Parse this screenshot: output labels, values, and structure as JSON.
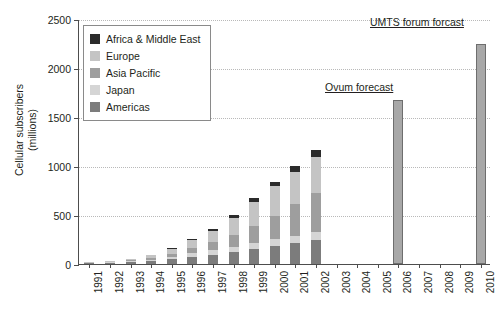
{
  "chart_data": {
    "type": "bar",
    "stacked": true,
    "title": "",
    "xlabel": "",
    "ylabel": "Cellular subscribers\n(millions)",
    "ylabel_line1": "Cellular subscribers",
    "ylabel_line2": "(millions)",
    "ylim": [
      0,
      2500
    ],
    "yticks": [
      0,
      500,
      1000,
      1500,
      2000,
      2500
    ],
    "ytick_labels": [
      "0",
      "500",
      "1000",
      "1500",
      "2000",
      "2500"
    ],
    "grid": "horizontal-dotted",
    "legend_position": "upper-left-inset",
    "categories": [
      "1991",
      "1992",
      "1993",
      "1994",
      "1995",
      "1996",
      "1997",
      "1998",
      "1999",
      "2000",
      "2001",
      "2002",
      "2003",
      "2004",
      "2005",
      "2006",
      "2007",
      "2008",
      "2009",
      "2010"
    ],
    "series": [
      {
        "name": "Americas",
        "color": "#7c7c7c",
        "values": [
          8,
          13,
          22,
          34,
          52,
          72,
          95,
          120,
          152,
          186,
          215,
          242,
          null,
          null,
          null,
          null,
          null,
          null,
          null,
          null
        ]
      },
      {
        "name": "Japan",
        "color": "#d5d5d5",
        "values": [
          2,
          4,
          7,
          12,
          22,
          38,
          48,
          56,
          62,
          68,
          74,
          80,
          null,
          null,
          null,
          null,
          null,
          null,
          null,
          null
        ]
      },
      {
        "name": "Asia Pacific",
        "color": "#9e9e9e",
        "values": [
          2,
          4,
          8,
          16,
          30,
          52,
          78,
          118,
          170,
          240,
          320,
          400,
          null,
          null,
          null,
          null,
          null,
          null,
          null,
          null
        ]
      },
      {
        "name": "Europe",
        "color": "#c4c4c4",
        "values": [
          4,
          8,
          14,
          26,
          48,
          80,
          120,
          175,
          250,
          300,
          330,
          370,
          null,
          null,
          null,
          null,
          null,
          null,
          null,
          null
        ]
      },
      {
        "name": "Africa & Middle East",
        "color": "#2b2b2b",
        "values": [
          1,
          2,
          3,
          5,
          8,
          14,
          20,
          28,
          38,
          48,
          60,
          75,
          null,
          null,
          null,
          null,
          null,
          null,
          null,
          null
        ]
      }
    ],
    "totals": [
      17,
      31,
      54,
      93,
      160,
      256,
      361,
      497,
      672,
      842,
      999,
      1167,
      null,
      null,
      null,
      null,
      null,
      null,
      null,
      null
    ],
    "forecast_bars": [
      {
        "category": "2006",
        "value": 1670,
        "color": "#a8a8a8",
        "label": "Ovum forecast"
      },
      {
        "category": "2010",
        "value": 2250,
        "color": "#a8a8a8",
        "label": "UMTS forum forcast"
      }
    ],
    "annotations": [
      {
        "name": "umts-forum-forecast-label",
        "text": "UMTS forum forcast",
        "underline": true
      },
      {
        "name": "ovum-forecast-label",
        "text": "Ovum forecast",
        "underline": true
      }
    ]
  },
  "legend": {
    "items": [
      {
        "label": "Africa & Middle East",
        "color": "#2b2b2b"
      },
      {
        "label": "Europe",
        "color": "#c4c4c4"
      },
      {
        "label": "Asia Pacific",
        "color": "#9e9e9e"
      },
      {
        "label": "Japan",
        "color": "#d5d5d5"
      },
      {
        "label": "Americas",
        "color": "#7c7c7c"
      }
    ]
  },
  "colors": {
    "axis": "#4d4d4d",
    "grid": "#b9b9b9",
    "text": "#231f20",
    "forecast_bar": "#a8a8a8",
    "background": "#ffffff"
  }
}
